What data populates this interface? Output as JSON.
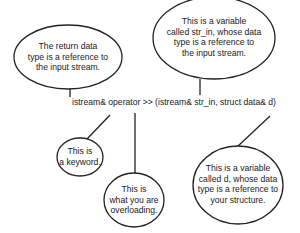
{
  "diagram": {
    "code_line": "istream& operator >> (istream& str_in, struct data& d)",
    "callouts": {
      "return_type": {
        "lines": [
          "The return data",
          "type is a reference to",
          "the input stream."
        ]
      },
      "str_in": {
        "lines": [
          "This is a variable",
          "called str_in, whose data",
          "type is a reference to",
          "the input stream."
        ]
      },
      "keyword": {
        "lines": [
          "This is",
          "a keyword."
        ]
      },
      "overloading": {
        "lines": [
          "This is",
          "what you are",
          "overloading."
        ]
      },
      "d_param": {
        "lines": [
          "This is a variable",
          "called d, whose data",
          "type is a reference to",
          "your structure."
        ]
      }
    },
    "colors": {
      "stroke": "#222222",
      "text": "#1a1a1a",
      "background": "#ffffff"
    }
  }
}
